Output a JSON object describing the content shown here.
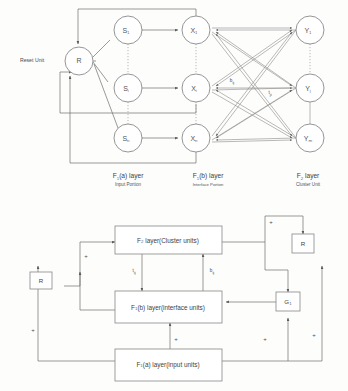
{
  "figure": {
    "top_diagram": {
      "name": "ART1 unit-level architecture",
      "reset_label": "Reset Unit",
      "reset_node": {
        "label": "R"
      },
      "input_nodes": [
        {
          "label": "S",
          "sub": "1"
        },
        {
          "label": "S",
          "sub": "i"
        },
        {
          "label": "S",
          "sub": "n"
        }
      ],
      "interface_nodes": [
        {
          "label": "X",
          "sub": "1"
        },
        {
          "label": "X",
          "sub": "i"
        },
        {
          "label": "X",
          "sub": "n"
        }
      ],
      "cluster_nodes": [
        {
          "label": "Y",
          "sub": "1"
        },
        {
          "label": "Y",
          "sub": "j"
        },
        {
          "label": "Y",
          "sub": "m"
        }
      ],
      "weights": [
        {
          "label": "b",
          "sub": "ij"
        },
        {
          "label": "t",
          "sub": "ji"
        }
      ],
      "captions": [
        {
          "main": "F",
          "main_sub": "1",
          "main_rest": "(a) layer",
          "sub": "Input Portion"
        },
        {
          "main": "F",
          "main_sub": "1",
          "main_rest": "(b) layer",
          "sub": "Interface Portion"
        },
        {
          "main": "F",
          "main_sub": "2",
          "main_rest": " layer",
          "sub": "Cluster Unit"
        }
      ]
    },
    "bottom_diagram": {
      "name": "ART1 block-level architecture",
      "boxes": [
        {
          "id": "f2",
          "prefix": "F",
          "sub": "2",
          "rest": " layer(Cluster units)"
        },
        {
          "id": "f1b",
          "prefix": "F",
          "sub": "1",
          "rest": "(b) layer(interface units)"
        },
        {
          "id": "f1a",
          "prefix": "F",
          "sub": "1",
          "rest": "(a) layer(input units)"
        }
      ],
      "small_boxes": [
        {
          "id": "reset-left",
          "label": "R"
        },
        {
          "id": "reset-right",
          "label": "R"
        },
        {
          "id": "gain",
          "label": "G",
          "sub": "1"
        }
      ],
      "weights": [
        {
          "label": "t",
          "sub": "ij"
        },
        {
          "label": "b",
          "sub": "ij"
        }
      ],
      "plus_signs": [
        "+",
        "+",
        "+",
        "+",
        "+",
        "+"
      ]
    }
  }
}
